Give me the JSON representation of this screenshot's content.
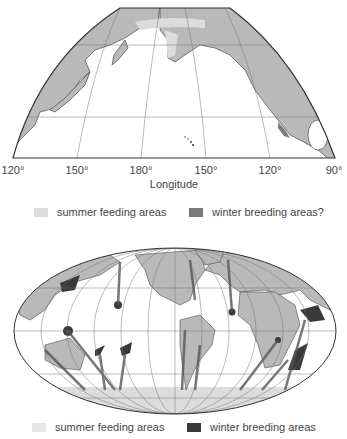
{
  "colors": {
    "land": "#b9b9b9",
    "summer_feeding": "#dcdcdc",
    "winter_breeding_top": "#7a7a7a",
    "winter_breeding_bottom": "#3a3a3a",
    "outline": "#333333",
    "grid": "#777777"
  },
  "top_map": {
    "title": "North Pacific map",
    "tick_labels": [
      "120°",
      "150°",
      "180°",
      "150°",
      "120°",
      "90°"
    ],
    "axis_label": "Longitude",
    "legend": [
      {
        "label": "summer feeding areas",
        "kind": "summer"
      },
      {
        "label": "winter breeding areas?",
        "kind": "winter"
      }
    ]
  },
  "bottom_map": {
    "title": "World map (Mollweide) with migration routes",
    "legend": [
      {
        "label": "summer feeding areas",
        "kind": "summer"
      },
      {
        "label": "winter breeding areas",
        "kind": "winter"
      }
    ]
  }
}
